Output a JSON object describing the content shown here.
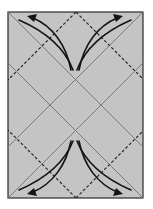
{
  "diagram": {
    "type": "origami-fold-diagram",
    "colors": {
      "paper": "#c4c4c4",
      "outline": "#2a2a2a",
      "solid_fold": "#7a7a7a",
      "dashed_fold": "#1e1e1e",
      "arrow": "#141414",
      "background": "#ffffff"
    },
    "paper_rect": {
      "x": 8,
      "y": 12,
      "width": 135,
      "height": 186
    },
    "solid_lines": [
      {
        "x1": 8,
        "y1": 12,
        "x2": 143,
        "y2": 147
      },
      {
        "x1": 143,
        "y1": 12,
        "x2": 8,
        "y2": 147
      },
      {
        "x1": 8,
        "y1": 63,
        "x2": 143,
        "y2": 198
      },
      {
        "x1": 143,
        "y1": 63,
        "x2": 8,
        "y2": 198
      }
    ],
    "dashed_lines": [
      {
        "x1": 76,
        "y1": 12,
        "x2": 8,
        "y2": 80
      },
      {
        "x1": 76,
        "y1": 12,
        "x2": 143,
        "y2": 79
      },
      {
        "x1": 76,
        "y1": 198,
        "x2": 8,
        "y2": 130
      },
      {
        "x1": 76,
        "y1": 198,
        "x2": 143,
        "y2": 131
      }
    ],
    "arrows": [
      {
        "name": "top-left-arrow",
        "direction": "up-left"
      },
      {
        "name": "top-right-arrow",
        "direction": "up-right"
      },
      {
        "name": "bottom-left-arrow",
        "direction": "down-left"
      },
      {
        "name": "bottom-right-arrow",
        "direction": "down-right"
      }
    ]
  }
}
